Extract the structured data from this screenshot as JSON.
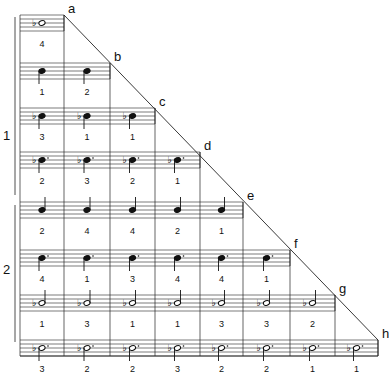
{
  "columns_x": [
    20,
    64,
    110,
    155,
    200,
    243,
    290,
    335,
    378
  ],
  "groups": [
    {
      "label": "1",
      "y": 128
    },
    {
      "label": "2",
      "y": 262
    }
  ],
  "rows": [
    {
      "letter": "a",
      "staff_top": 15,
      "note": "whole-flat-natural",
      "fingerings": [
        "4"
      ]
    },
    {
      "letter": "b",
      "staff_top": 63,
      "note": "eighth-stem-down",
      "fingerings": [
        "1",
        "2"
      ]
    },
    {
      "letter": "c",
      "staff_top": 108,
      "note": "flat-eighth",
      "fingerings": [
        "3",
        "1",
        "1"
      ]
    },
    {
      "letter": "d",
      "staff_top": 152,
      "note": "flat-dotted-eighth",
      "fingerings": [
        "2",
        "3",
        "2",
        "1"
      ]
    },
    {
      "letter": "e",
      "staff_top": 202,
      "note": "quarter-stem-up",
      "fingerings": [
        "2",
        "4",
        "4",
        "2",
        "1"
      ]
    },
    {
      "letter": "f",
      "staff_top": 250,
      "note": "dotted-quarter-stem-down",
      "fingerings": [
        "4",
        "1",
        "3",
        "4",
        "4",
        "1"
      ]
    },
    {
      "letter": "g",
      "staff_top": 295,
      "note": "flat-half-stem-up",
      "fingerings": [
        "1",
        "3",
        "1",
        "1",
        "3",
        "3",
        "2"
      ]
    },
    {
      "letter": "h",
      "staff_top": 340,
      "note": "flat-dotted-half-stem-down",
      "fingerings": [
        "3",
        "2",
        "2",
        "3",
        "2",
        "2",
        "1",
        "1"
      ]
    }
  ],
  "letter_labels": [
    "a",
    "b",
    "c",
    "d",
    "e",
    "f",
    "g",
    "h"
  ]
}
